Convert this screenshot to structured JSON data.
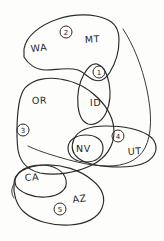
{
  "diagram": {
    "kind": "hand-drawn-venn-region-sketch",
    "background_color": "#fdfdfc",
    "ink_color": "#2b2b2b",
    "width": 164,
    "height": 241,
    "state_labels": [
      {
        "id": "wa",
        "text": "WA",
        "x": 31,
        "y": 52,
        "rotate": -6
      },
      {
        "id": "mt",
        "text": "MT",
        "x": 85,
        "y": 43,
        "rotate": -3
      },
      {
        "id": "or",
        "text": "OR",
        "x": 32,
        "y": 104,
        "rotate": -2
      },
      {
        "id": "id",
        "text": "ID",
        "x": 90,
        "y": 106,
        "rotate": -2
      },
      {
        "id": "nv",
        "text": "NV",
        "x": 76,
        "y": 150,
        "rotate": 0
      },
      {
        "id": "ut",
        "text": "UT",
        "x": 128,
        "y": 155,
        "rotate": -4
      },
      {
        "id": "ca",
        "text": "CA",
        "x": 25,
        "y": 181,
        "rotate": -4
      },
      {
        "id": "az",
        "text": "AZ",
        "x": 73,
        "y": 203,
        "rotate": -8
      }
    ],
    "region_badges": [
      {
        "id": "badge-1",
        "label": "1",
        "x": 99,
        "y": 72,
        "r": 6
      },
      {
        "id": "badge-2",
        "label": "2",
        "x": 66,
        "y": 32,
        "r": 6
      },
      {
        "id": "badge-3",
        "label": "3",
        "x": 23,
        "y": 130,
        "r": 6
      },
      {
        "id": "badge-4",
        "label": "4",
        "x": 118,
        "y": 136,
        "r": 6
      },
      {
        "id": "badge-5",
        "label": "5",
        "x": 60,
        "y": 209,
        "r": 6
      }
    ],
    "regions": [
      {
        "id": "region-2-top",
        "badge": "2",
        "members": [
          "WA",
          "MT"
        ]
      },
      {
        "id": "region-1-lens",
        "badge": "1",
        "members": [
          "ID"
        ]
      },
      {
        "id": "region-3-left",
        "badge": "3",
        "members": [
          "OR"
        ]
      },
      {
        "id": "region-4-right",
        "badge": "4",
        "members": [
          "NV",
          "UT"
        ]
      },
      {
        "id": "region-5-bottom",
        "badge": "5",
        "members": [
          "CA",
          "AZ"
        ]
      },
      {
        "id": "region-nv-inner",
        "badge": "",
        "members": [
          "NV"
        ]
      }
    ]
  }
}
